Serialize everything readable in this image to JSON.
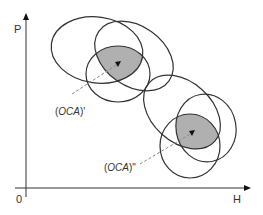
{
  "axes": {
    "y_label": "P",
    "x_label": "H",
    "origin_label": "0"
  },
  "labels": {
    "upper_point": {
      "prefix": "(",
      "name": "OCA",
      "suffix": ")'"
    },
    "lower_point": {
      "prefix": "(",
      "name": "OCA",
      "suffix": ")\""
    }
  },
  "colors": {
    "stroke": "#333333",
    "shade": "#b0b0b0",
    "dash": "#888888"
  },
  "clusters": [
    {
      "name": "upper",
      "ellipse_count": 3,
      "label": "(OCA)'"
    },
    {
      "name": "lower",
      "ellipse_count": 3,
      "label": "(OCA)\""
    }
  ]
}
